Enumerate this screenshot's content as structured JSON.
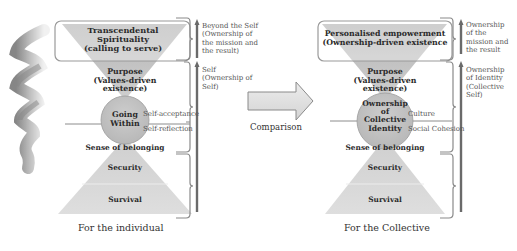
{
  "left": {
    "top_box": "Transcendental Spirituality (calling to serve)",
    "top_box_lines": [
      "Transcendental",
      "Spirituality",
      "(calling to serve)"
    ],
    "purpose_lines": [
      "Purpose",
      "(Values-driven",
      "existence)"
    ],
    "circle_lines": [
      "Going",
      "Within"
    ],
    "belonging": "Sense of belonging",
    "security": "Security",
    "survival": "Survival",
    "line_label_upper": "Self-acceptance",
    "line_label_lower": "Self-reflection",
    "side_upper_lines": [
      "Beyond the Self",
      "(Ownership of",
      "the mission and",
      "the result)"
    ],
    "side_lower_lines": [
      "Self",
      "(Ownership of",
      "Self)"
    ],
    "caption": "For the individual"
  },
  "middle": {
    "arrow_label": "Comparison"
  },
  "right": {
    "top_box_lines": [
      "Personalised empowerment",
      "(Ownership-driven existence"
    ],
    "purpose_lines": [
      "Purpose",
      "(Values-driven",
      "existence)"
    ],
    "circle_lines": [
      "Ownership",
      "of",
      "Collective",
      "Identity"
    ],
    "belonging": "Sense of belonging",
    "security": "Security",
    "survival": "Survival",
    "line_label_upper": "Culture",
    "line_label_lower": "Social Cohesion",
    "side_upper_lines": [
      "Ownership",
      "of the",
      "mission and",
      "the result"
    ],
    "side_lower_lines": [
      "Ownership",
      "of Identity",
      "(Collective",
      "Self)"
    ],
    "caption": "For the Collective"
  },
  "colors": {
    "funnel_top": "#b9b9b9",
    "funnel_bottom": "#d6d6d6",
    "circle": "#c2c2c2",
    "pyramid": "#d9d9d9",
    "bracket": "#8a8a8a",
    "arrow": "#6e6e6e"
  }
}
